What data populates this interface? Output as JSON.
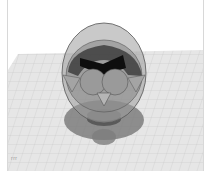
{
  "app": {
    "view": "3d-workplane-viewport"
  },
  "scene": {
    "workplane": {
      "grid": true,
      "color": "#e4e4e4",
      "line_color": "#c9c9c9"
    },
    "model": {
      "name": "owl-shape",
      "body_color": "#8c8c8c",
      "shell_color": "#9a9a9a",
      "brow_color": "#111111",
      "shadow_color": "#7a7a7a"
    }
  },
  "overlay": {
    "scale_label": "rrr"
  }
}
